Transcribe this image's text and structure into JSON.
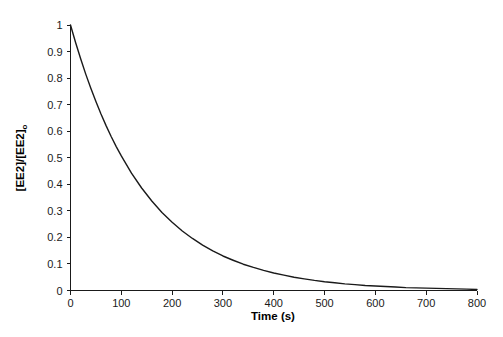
{
  "chart_data": {
    "type": "line",
    "title": "",
    "xlabel": "Time (s)",
    "ylabel": "[EE2]/[EE2]",
    "ylabel_subscript": "o",
    "xlim": [
      0,
      800
    ],
    "ylim": [
      0,
      1
    ],
    "grid": false,
    "legend": false,
    "line_color": "#1a1a1a",
    "background_color": "#ffffff",
    "xticks": [
      0,
      100,
      200,
      300,
      400,
      500,
      600,
      700,
      800
    ],
    "xtick_labels": [
      "0",
      "100",
      "200",
      "300",
      "400",
      "500",
      "600",
      "700",
      "800"
    ],
    "yticks": [
      0,
      0.1,
      0.2,
      0.3,
      0.4,
      0.5,
      0.6,
      0.7,
      0.8,
      0.9,
      1
    ],
    "ytick_labels": [
      "0",
      "0.1",
      "0.2",
      "0.3",
      "0.4",
      "0.5",
      "0.6",
      "0.7",
      "0.8",
      "0.9",
      "1"
    ],
    "series": [
      {
        "name": "EE2 decay",
        "model": "first-order exponential decay",
        "rate_constant_per_s": 0.0068,
        "x": [
          0,
          10,
          20,
          30,
          40,
          50,
          60,
          70,
          80,
          90,
          100,
          120,
          140,
          160,
          180,
          200,
          220,
          240,
          260,
          280,
          300,
          320,
          340,
          360,
          380,
          400,
          420,
          440,
          460,
          480,
          500,
          520,
          540,
          560,
          580,
          600,
          620,
          640,
          660,
          680,
          700,
          720,
          740,
          760,
          780,
          800
        ],
        "y": [
          1.0,
          0.934,
          0.873,
          0.815,
          0.762,
          0.712,
          0.665,
          0.621,
          0.58,
          0.542,
          0.507,
          0.442,
          0.386,
          0.337,
          0.294,
          0.257,
          0.224,
          0.196,
          0.171,
          0.149,
          0.13,
          0.114,
          0.099,
          0.087,
          0.076,
          0.066,
          0.058,
          0.05,
          0.044,
          0.038,
          0.033,
          0.029,
          0.025,
          0.022,
          0.019,
          0.017,
          0.015,
          0.013,
          0.011,
          0.01,
          0.009,
          0.008,
          0.007,
          0.006,
          0.005,
          0.004
        ]
      }
    ]
  }
}
